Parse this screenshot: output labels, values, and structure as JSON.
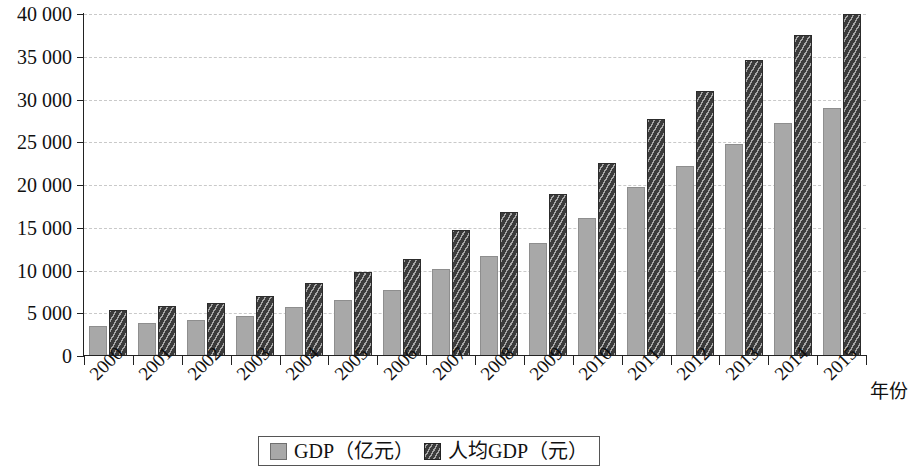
{
  "chart_data": {
    "type": "bar",
    "title": "",
    "subtitle": "",
    "xlabel": "年份",
    "ylabel": "",
    "ylim": [
      0,
      40000
    ],
    "ytick_labels": [
      "0",
      "5 000",
      "10 000",
      "15 000",
      "20 000",
      "25 000",
      "30 000",
      "35 000",
      "40 000"
    ],
    "ytick_values": [
      0,
      5000,
      10000,
      15000,
      20000,
      25000,
      30000,
      35000,
      40000
    ],
    "grid": true,
    "legend_position": "bottom-center",
    "categories": [
      "2000",
      "2001",
      "2002",
      "2003",
      "2004",
      "2005",
      "2006",
      "2007",
      "2008",
      "2009",
      "2010",
      "2011",
      "2012",
      "2013",
      "2014",
      "2015"
    ],
    "series": [
      {
        "name": "GDP（亿元）",
        "color": "#a8a8a8",
        "pattern": "solid",
        "values": [
          3500,
          3900,
          4200,
          4700,
          5700,
          6600,
          7700,
          10200,
          11700,
          13200,
          16100,
          19800,
          22200,
          24800,
          27200,
          29000
        ]
      },
      {
        "name": "人均GDP（元）",
        "color": "#3b3b3b",
        "pattern": "diagonal-hatch",
        "values": [
          5400,
          5800,
          6200,
          7000,
          8500,
          9800,
          11400,
          14700,
          16900,
          19000,
          22600,
          27700,
          31000,
          34600,
          37600,
          40000
        ]
      }
    ]
  },
  "legend": {
    "entries": [
      {
        "label": "GDP（亿元）",
        "swatch": "gdp"
      },
      {
        "label": "人均GDP（元）",
        "swatch": "pc"
      }
    ]
  }
}
